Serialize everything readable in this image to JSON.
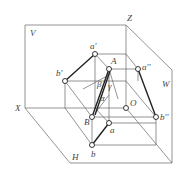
{
  "diagram": {
    "planes": {
      "V": "V",
      "H": "H",
      "W": "W"
    },
    "axes": {
      "X": "X",
      "Z": "Z",
      "O": "O"
    },
    "points": {
      "a_prime": "a'",
      "A": "A",
      "a_double_prime": "a''",
      "b_prime": "b'",
      "B": "B",
      "b_double_prime": "b''",
      "a": "a",
      "b": "b"
    },
    "angles": {
      "alpha": "α",
      "beta": "β",
      "gamma": "γ"
    },
    "colors": {
      "line": "#555555",
      "thick": "#222222",
      "background": "#ffffff"
    }
  }
}
